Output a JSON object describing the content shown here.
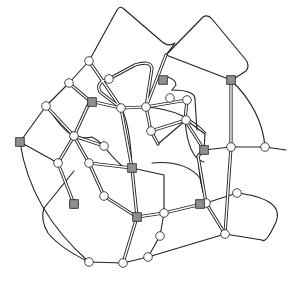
{
  "diagram": {
    "title": "",
    "background": "#ffffff",
    "line_color": "#222222",
    "square_fill": "#8f8f8f",
    "circle_fill": "#ffffff",
    "single_edges": [
      "M89,61 L117,10 Q120,5 124,9 L160,40 Q168,48 175,43 L166,55",
      "M166,55 L203,17 Q208,14 212,19 L246,60 Q250,66 246,71 L232,80",
      "M166,55 L231,80",
      "M89,61 L69,83 L46,106 L20,142",
      "M20,142 Q30,210 89,262",
      "M20,142 L58,163",
      "M231,80 Q262,110 265,147",
      "M231,147 L265,147",
      "M265,147 L286,150",
      "M204,150 L231,147",
      "M237,193 Q285,199 276,222 Q266,244 262,240 L225,234",
      "M225,234 L148,257 L123,263",
      "M89,262 L123,263",
      "M89,262 Q60,248 48,233 Q40,220 44,208 L74,171",
      "M148,257 L160,236 L164,213",
      "M132,168 L164,175 L164,213",
      "M158,144 L186,120",
      "M186,120 L205,134 L204,150",
      "M152,163 Q185,160 200,178 L206,203",
      "M206,203 L237,193",
      "M47,106 Q63,132 77,138 L104,146",
      "M104,146 Q110,155 122,166",
      "M121,108 Q130,123 132,168",
      "M168,77 Q176,80 176,85 L172,90",
      "M172,90 Q196,90 195,100 L197,130",
      "M146,107 Q185,110 206,133",
      "M185,120 Q188,158 204,162",
      "M198,156 L199,168 Q200,180 203,192",
      "M73,132 Q80,140 92,137 Q98,140 104,146"
    ],
    "double_edges": [
      "M89,61 L121,108",
      "M69,83 L90,101 L121,108",
      "M109,79 Q95,82 100,92 L121,108",
      "M46,106 L74,136 L104,146",
      "M90,101 L74,136 L58,163",
      "M74,136 L89,163",
      "M121,108 L132,168",
      "M121,108 L146,107",
      "M166,55 L146,107 L151,131 L158,144",
      "M146,107 L187,100",
      "M231,80 L231,147 L225,234",
      "M187,100 L185,120 L204,150",
      "M89,163 L132,168",
      "M58,163 L74,204",
      "M89,163 L104,196",
      "M132,168 L137,217",
      "M104,196 L137,217",
      "M137,217 L164,213",
      "M137,217 L123,263",
      "M164,213 L206,203",
      "M206,203 L225,234",
      "M204,150 L198,156 L206,203",
      "M151,131 L186,120",
      "M109,79 L135,65 Q150,60 152,68 L146,107"
    ],
    "circle_nodes": [
      {
        "id": "c1",
        "x": 89,
        "y": 61
      },
      {
        "id": "c2",
        "x": 69,
        "y": 83
      },
      {
        "id": "c3",
        "x": 109,
        "y": 79
      },
      {
        "id": "c4",
        "x": 46,
        "y": 106
      },
      {
        "id": "c5",
        "x": 121,
        "y": 108
      },
      {
        "id": "c6",
        "x": 74,
        "y": 136
      },
      {
        "id": "c7",
        "x": 146,
        "y": 107
      },
      {
        "id": "c8",
        "x": 187,
        "y": 100
      },
      {
        "id": "c9",
        "x": 151,
        "y": 131
      },
      {
        "id": "c10",
        "x": 58,
        "y": 163
      },
      {
        "id": "c11",
        "x": 104,
        "y": 146
      },
      {
        "id": "c12",
        "x": 89,
        "y": 163
      },
      {
        "id": "c13",
        "x": 231,
        "y": 147
      },
      {
        "id": "c14",
        "x": 265,
        "y": 147
      },
      {
        "id": "c15",
        "x": 170,
        "y": 98
      },
      {
        "id": "c16",
        "x": 186,
        "y": 120
      },
      {
        "id": "c17",
        "x": 237,
        "y": 193
      },
      {
        "id": "c18",
        "x": 206,
        "y": 203
      },
      {
        "id": "c19",
        "x": 164,
        "y": 213
      },
      {
        "id": "c20",
        "x": 104,
        "y": 196
      },
      {
        "id": "c21",
        "x": 225,
        "y": 234
      },
      {
        "id": "c22",
        "x": 160,
        "y": 236
      },
      {
        "id": "c23",
        "x": 148,
        "y": 257
      },
      {
        "id": "c24",
        "x": 89,
        "y": 262
      },
      {
        "id": "c25",
        "x": 123,
        "y": 263
      },
      {
        "id": "c26",
        "x": 74,
        "y": 204
      }
    ],
    "square_nodes": [
      {
        "id": "s1",
        "x": 92,
        "y": 102
      },
      {
        "id": "s2",
        "x": 163,
        "y": 80
      },
      {
        "id": "s3",
        "x": 231,
        "y": 80
      },
      {
        "id": "s4",
        "x": 20,
        "y": 142
      },
      {
        "id": "s5",
        "x": 132,
        "y": 168
      },
      {
        "id": "s6",
        "x": 204,
        "y": 150
      },
      {
        "id": "s7",
        "x": 74,
        "y": 204
      },
      {
        "id": "s8",
        "x": 137,
        "y": 217
      },
      {
        "id": "s9",
        "x": 200,
        "y": 204
      }
    ]
  }
}
